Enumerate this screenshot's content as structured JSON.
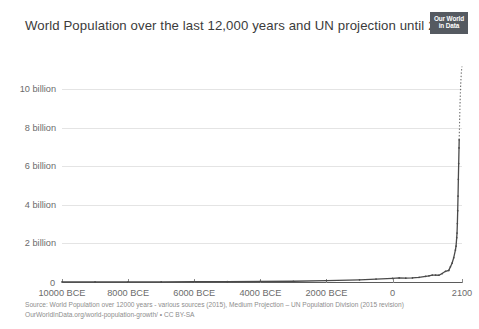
{
  "header": {
    "title": "World Population over the last 12,000 years and UN projection until 2100",
    "logo_line1": "Our World",
    "logo_line2": "in Data"
  },
  "footer": {
    "source_line": "Source: World Population over 12000 years - various sources (2015), Medium Projection – UN Population Division (2015 revision)",
    "license_line": "OurWorldInData.org/world-population-growth/ • CC BY-SA"
  },
  "colors": {
    "line": "#4a4a4a",
    "grid": "#e4e4e4",
    "axis": "#5b5b5b",
    "text": "#6b6b6b",
    "title": "#3b3b3b",
    "logo_bg": "#555a61"
  },
  "chart_data": {
    "type": "line",
    "title": "World Population over the last 12,000 years and UN projection until 2100",
    "xlabel": "",
    "ylabel": "",
    "xlim": [
      -10000,
      2100
    ],
    "ylim": [
      0,
      11000000000
    ],
    "grid": true,
    "legend": false,
    "ytick_labels": [
      "2 billion",
      "4 billion",
      "6 billion",
      "8 billion",
      "10 billion"
    ],
    "ytick_values": [
      2000000000,
      4000000000,
      6000000000,
      8000000000,
      10000000000
    ],
    "zero_label": "0",
    "xtick_labels": [
      "10000 BCE",
      "8000 BCE",
      "6000 BCE",
      "4000 BCE",
      "2000 BCE",
      "0",
      "2100"
    ],
    "xtick_values": [
      -10000,
      -8000,
      -6000,
      -4000,
      -2000,
      0,
      2100
    ],
    "projection_start_year": 2015,
    "series": [
      {
        "name": "World Population (historical)",
        "style": "solid",
        "x": [
          -10000,
          -9000,
          -8000,
          -7000,
          -6000,
          -5000,
          -4000,
          -3000,
          -2000,
          -1000,
          -500,
          0,
          200,
          400,
          600,
          800,
          1000,
          1100,
          1200,
          1300,
          1400,
          1500,
          1600,
          1700,
          1750,
          1800,
          1850,
          1900,
          1920,
          1940,
          1950,
          1960,
          1970,
          1980,
          1990,
          2000,
          2010,
          2015
        ],
        "y": [
          4000000,
          5000000,
          8000000,
          11000000,
          16000000,
          22000000,
          28000000,
          40000000,
          72000000,
          115000000,
          150000000,
          188000000,
          210000000,
          200000000,
          210000000,
          240000000,
          295000000,
          320000000,
          360000000,
          360000000,
          350000000,
          438000000,
          556000000,
          603000000,
          791000000,
          978000000,
          1262000000,
          1650000000,
          1860000000,
          2300000000,
          2536000000,
          3035000000,
          3700000000,
          4458000000,
          5327000000,
          6145000000,
          6958000000,
          7380000000
        ]
      },
      {
        "name": "UN Medium Projection",
        "style": "dotted",
        "x": [
          2015,
          2020,
          2030,
          2040,
          2050,
          2060,
          2070,
          2080,
          2090,
          2100
        ],
        "y": [
          7380000000,
          7795000000,
          8551000000,
          9210000000,
          9772000000,
          10222000000,
          10577000000,
          10851000000,
          11053000000,
          11184000000
        ]
      }
    ]
  }
}
